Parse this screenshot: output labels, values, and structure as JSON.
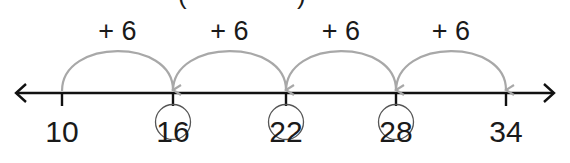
{
  "title_fragment": {
    "left": "(",
    "right": ")"
  },
  "number_line": {
    "start": 10,
    "step": 6,
    "ticks": [
      {
        "value": "10",
        "circled": false
      },
      {
        "value": "16",
        "circled": true
      },
      {
        "value": "22",
        "circled": true
      },
      {
        "value": "28",
        "circled": true
      },
      {
        "value": "34",
        "circled": false
      }
    ],
    "jumps": [
      {
        "label": "+ 6",
        "from": 10,
        "to": 16
      },
      {
        "label": "+ 6",
        "from": 16,
        "to": 22
      },
      {
        "label": "+ 6",
        "from": 22,
        "to": 28
      },
      {
        "label": "+ 6",
        "from": 28,
        "to": 34
      }
    ],
    "arrows_both_ends": true
  },
  "colors": {
    "axis": "#111111",
    "arc": "#a8a8a8",
    "circle": "#555555",
    "text": "#1a1a1a"
  }
}
